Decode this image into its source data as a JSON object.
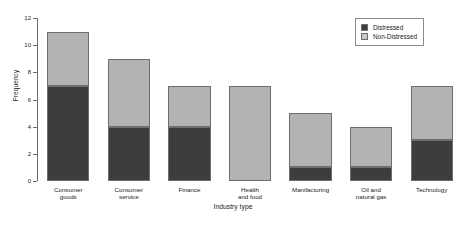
{
  "chart_data": {
    "type": "bar",
    "subtype": "stacked-bar",
    "title": "",
    "xlabel": "Industry type",
    "ylabel": "Frequency",
    "ylim": [
      0,
      12
    ],
    "yticks": [
      0,
      2,
      4,
      6,
      8,
      10,
      12
    ],
    "ytick_labels": [
      "0",
      "2",
      "4",
      "6",
      "8",
      "10",
      "12"
    ],
    "grid": false,
    "legend_position": "top-right",
    "categories": [
      "Consumer goods",
      "Consumer service",
      "Finance",
      "Health and food",
      "Manifacturing",
      "Oil and natural gas",
      "Technology"
    ],
    "category_lines": [
      [
        "Consumer",
        "goods"
      ],
      [
        "Consumer",
        "service"
      ],
      [
        "Finance"
      ],
      [
        "Health",
        "and food"
      ],
      [
        "Manifacturing"
      ],
      [
        "Oil and",
        "natural gas"
      ],
      [
        "Technology"
      ]
    ],
    "series": [
      {
        "name": "Distressed",
        "color": "#3d3d3d",
        "values": [
          7,
          4,
          4,
          0,
          1,
          1,
          3
        ]
      },
      {
        "name": "Non-Distressed",
        "color": "#b3b3b3",
        "values": [
          4,
          5,
          3,
          7,
          4,
          3,
          4
        ]
      }
    ],
    "totals": [
      11,
      9,
      7,
      7,
      5,
      4,
      7
    ]
  },
  "legend": {
    "items": [
      {
        "label": "Distressed",
        "swatch": "#3d3d3d"
      },
      {
        "label": "Non-Distressed",
        "swatch": "#c9c9c9"
      }
    ]
  },
  "colors": {
    "distressed": "#3d3d3d",
    "non_distressed": "#b3b3b3",
    "axis": "#6b6b6b",
    "background": "#ffffff"
  }
}
